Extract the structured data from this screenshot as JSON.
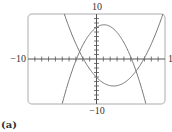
{
  "chart_data": {
    "type": "line",
    "title": "",
    "caption": "(a)",
    "xlabel": "",
    "ylabel": "",
    "xlim": [
      -10,
      10
    ],
    "ylim": [
      -10,
      10
    ],
    "grid": false,
    "tick_step": 1,
    "axis_labels": {
      "x_min": "−10",
      "x_max": "10",
      "y_min": "−10",
      "y_max": "10"
    },
    "series": [
      {
        "name": "downward-parabola",
        "shape": "concave-down",
        "vertex": [
          1.1,
          7.6
        ],
        "x": [
          -5,
          -4,
          -3,
          -2,
          -1,
          0,
          1,
          1.1,
          2,
          3,
          4,
          5,
          6,
          7,
          7.2
        ],
        "y": [
          -9.9,
          -6.2,
          -3.3,
          -0.9,
          5.5,
          7.0,
          7.6,
          7.6,
          7.2,
          5.9,
          3.6,
          0.5,
          -3.7,
          -8.8,
          -9.9
        ]
      },
      {
        "name": "upward-parabola",
        "shape": "concave-up",
        "vertex": [
          2.5,
          -6.0
        ],
        "x": [
          -4.7,
          -4,
          -3,
          -2,
          -1,
          0,
          1,
          2,
          2.5,
          3,
          4,
          5,
          6,
          7,
          8,
          9,
          9.7
        ],
        "y": [
          10.0,
          7.1,
          3.4,
          0.3,
          -2.2,
          -4.1,
          -5.3,
          -5.9,
          -6.0,
          -5.9,
          -5.3,
          -4.1,
          -2.2,
          0.3,
          3.4,
          7.1,
          10.0
        ]
      }
    ]
  },
  "labels": {
    "x_min": "−10",
    "x_max": "1",
    "y_max": "10",
    "y_min": "−10",
    "caption": "(a)"
  },
  "colors": {
    "frame": "#c8c8c8",
    "axis": "#555555",
    "curve": "#777777",
    "text": "#333333"
  }
}
